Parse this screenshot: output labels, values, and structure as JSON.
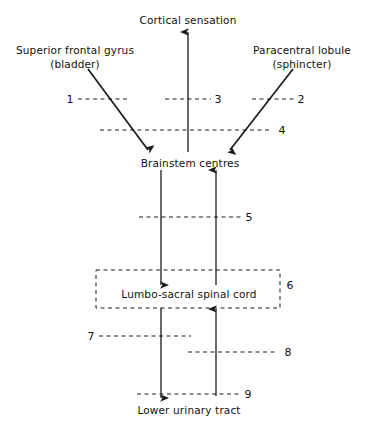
{
  "figure": {
    "type": "neuroanatomy-flow-diagram",
    "background_color": "#ffffff",
    "line_color": "#1a1a1a",
    "width": 367,
    "height": 434
  },
  "nodes": [
    {
      "id": "cortical-sensation",
      "label": "Cortical sensation",
      "x": 188,
      "y": 14
    },
    {
      "id": "superior-frontal-gyrus",
      "label": "Superior frontal gyrus",
      "x": 75,
      "y": 44
    },
    {
      "id": "superior-frontal-gyrus-sub",
      "label": "(bladder)",
      "x": 75,
      "y": 58
    },
    {
      "id": "paracentral-lobule",
      "label": "Paracentral lobule",
      "x": 302,
      "y": 44
    },
    {
      "id": "paracentral-lobule-sub",
      "label": "(sphincter)",
      "x": 302,
      "y": 58
    },
    {
      "id": "brainstem-centres",
      "label": "Brainstem centres",
      "x": 190,
      "y": 157
    },
    {
      "id": "lumbo-sacral-spinal-cord",
      "label": "Lumbo-sacral spinal cord",
      "x": 189,
      "y": 288
    },
    {
      "id": "lower-urinary-tract",
      "label": "Lower urinary tract",
      "x": 189,
      "y": 404
    }
  ],
  "pathway_numbers": [
    {
      "id": "1",
      "label": "1",
      "x": 70,
      "y": 99
    },
    {
      "id": "2",
      "label": "2",
      "x": 301,
      "y": 99
    },
    {
      "id": "3",
      "label": "3",
      "x": 218,
      "y": 99
    },
    {
      "id": "4",
      "label": "4",
      "x": 282,
      "y": 130
    },
    {
      "id": "5",
      "label": "5",
      "x": 249,
      "y": 217
    },
    {
      "id": "6",
      "label": "6",
      "x": 290,
      "y": 285
    },
    {
      "id": "7",
      "label": "7",
      "x": 91,
      "y": 336
    },
    {
      "id": "8",
      "label": "8",
      "x": 288,
      "y": 352
    },
    {
      "id": "9",
      "label": "9",
      "x": 248,
      "y": 394
    }
  ],
  "connections": [
    {
      "id": "cortical-ascending-arrow",
      "from": "brainstem-centres",
      "to": "cortical-sensation",
      "direction": "up",
      "style": "solid"
    },
    {
      "id": "superior-frontal-descending-arrow",
      "from": "superior-frontal-gyrus",
      "to": "brainstem-centres",
      "direction": "down-right",
      "style": "solid"
    },
    {
      "id": "paracentral-descending-arrow",
      "from": "paracentral-lobule",
      "to": "brainstem-centres",
      "direction": "down-left",
      "style": "solid"
    },
    {
      "id": "brainstem-to-cord-descending",
      "from": "brainstem-centres",
      "to": "lumbo-sacral-spinal-cord",
      "direction": "down",
      "style": "solid"
    },
    {
      "id": "cord-to-brainstem-ascending",
      "from": "lumbo-sacral-spinal-cord",
      "to": "brainstem-centres",
      "direction": "up",
      "style": "solid"
    },
    {
      "id": "cord-to-tract-descending",
      "from": "lumbo-sacral-spinal-cord",
      "to": "lower-urinary-tract",
      "direction": "down",
      "style": "solid"
    },
    {
      "id": "tract-to-cord-ascending",
      "from": "lower-urinary-tract",
      "to": "lumbo-sacral-spinal-cord",
      "direction": "up",
      "style": "solid"
    }
  ],
  "cut-markers": [
    {
      "id": "cut-1",
      "number": "1",
      "x1": 78,
      "x2": 129,
      "y": 99
    },
    {
      "id": "cut-3",
      "number": "3",
      "x1": 165,
      "x2": 211,
      "y": 99
    },
    {
      "id": "cut-2",
      "number": "2",
      "x1": 252,
      "x2": 294,
      "y": 99
    },
    {
      "id": "cut-4",
      "number": "4",
      "x1": 100,
      "x2": 270,
      "y": 130
    },
    {
      "id": "cut-5",
      "number": "5",
      "x1": 139,
      "x2": 241,
      "y": 217
    },
    {
      "id": "cut-7",
      "number": "7",
      "x1": 99,
      "x2": 191,
      "y": 336
    },
    {
      "id": "cut-8",
      "number": "8",
      "x1": 188,
      "x2": 277,
      "y": 352
    },
    {
      "id": "cut-9",
      "number": "9",
      "x1": 137,
      "x2": 241,
      "y": 394
    }
  ],
  "box": {
    "id": "spinal-cord-box",
    "label": "Lumbo-sacral spinal cord",
    "number": "6",
    "x": 96,
    "y": 270,
    "width": 184,
    "height": 38,
    "style": "dashed"
  }
}
